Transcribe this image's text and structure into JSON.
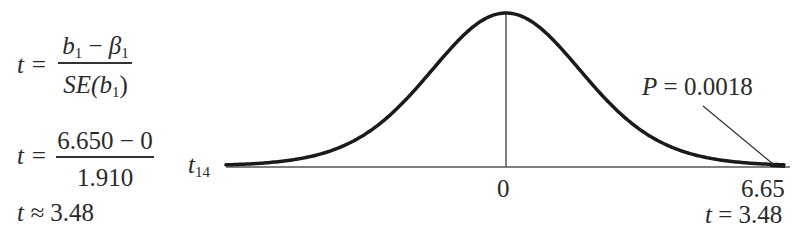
{
  "formulas": {
    "eq1": {
      "lhs": "t =",
      "num_b": "b",
      "num_b_sub": "1",
      "num_op": " − ",
      "num_beta": "β",
      "num_beta_sub": "1",
      "den_prefix": "SE(",
      "den_b": "b",
      "den_b_sub": "1",
      "den_suffix": ")"
    },
    "eq2": {
      "lhs": "t =",
      "numerator": "6.650 − 0",
      "denominator": "1.910"
    },
    "eq3": {
      "lhs": "t ≈",
      "value": "3.48"
    }
  },
  "diagram": {
    "dist_label": "t",
    "dist_label_sub": "14",
    "center_tick": "0",
    "observed_value": "6.65",
    "t_label": "t = 3.48",
    "p_label_var": "P",
    "p_label_value": " = 0.0018"
  },
  "chart_data": {
    "type": "line",
    "title": "",
    "distribution": "t distribution, 14 degrees of freedom",
    "x_ticks": [
      "0",
      "6.65"
    ],
    "annotations": [
      "P = 0.0018",
      "t = 3.48",
      "t_14"
    ],
    "shaded_tail": "right tail beyond t = 3.48",
    "p_value": 0.0018,
    "t_statistic": 3.48,
    "df": 14
  },
  "colors": {
    "curve": "#1a1a1a",
    "axis": "#555555",
    "text": "#2a2a2a"
  }
}
